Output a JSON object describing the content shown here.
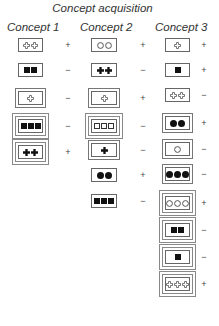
{
  "title": "Concept acquisition",
  "columns": [
    {
      "label": "Concept 1",
      "items": [
        {
          "border": 1,
          "shape": "cross",
          "fill": "outline",
          "count": 2,
          "sign": "+"
        },
        {
          "border": 1,
          "shape": "square",
          "fill": "filled",
          "count": 2,
          "sign": "−"
        },
        {
          "border": 2,
          "shape": "cross",
          "fill": "outline",
          "count": 1,
          "sign": "−"
        },
        {
          "border": 3,
          "shape": "square",
          "fill": "filled",
          "count": 3,
          "sign": "−"
        },
        {
          "border": 3,
          "shape": "cross",
          "fill": "filled",
          "count": 2,
          "sign": "+"
        }
      ]
    },
    {
      "label": "Concept 2",
      "items": [
        {
          "border": 1,
          "shape": "circle",
          "fill": "outline",
          "count": 2,
          "sign": "+"
        },
        {
          "border": 1,
          "shape": "cross",
          "fill": "filled",
          "count": 2,
          "sign": "−"
        },
        {
          "border": 2,
          "shape": "cross",
          "fill": "outline",
          "count": 1,
          "sign": "+"
        },
        {
          "border": 3,
          "shape": "square",
          "fill": "outline",
          "count": 3,
          "sign": "−"
        },
        {
          "border": 2,
          "shape": "cross",
          "fill": "filled",
          "count": 1,
          "sign": "−"
        },
        {
          "border": 1,
          "shape": "circle",
          "fill": "filled",
          "count": 2,
          "sign": "+"
        },
        {
          "border": 1,
          "shape": "square",
          "fill": "filled",
          "count": 3,
          "sign": "−"
        }
      ]
    },
    {
      "label": "Concept 3",
      "items": [
        {
          "border": 1,
          "shape": "cross",
          "fill": "outline",
          "count": 1,
          "sign": "+"
        },
        {
          "border": 1,
          "shape": "square",
          "fill": "filled",
          "count": 1,
          "sign": "+"
        },
        {
          "border": 1,
          "shape": "cross",
          "fill": "outline",
          "count": 2,
          "sign": "−"
        },
        {
          "border": 2,
          "shape": "circle",
          "fill": "filled",
          "count": 2,
          "sign": "+"
        },
        {
          "border": 2,
          "shape": "circle",
          "fill": "outline",
          "count": 1,
          "sign": "−"
        },
        {
          "border": 2,
          "shape": "circle",
          "fill": "filled",
          "count": 3,
          "sign": "−"
        },
        {
          "border": 3,
          "shape": "circle",
          "fill": "outline",
          "count": 3,
          "sign": "+"
        },
        {
          "border": 3,
          "shape": "square",
          "fill": "filled",
          "count": 2,
          "sign": "−"
        },
        {
          "border": 3,
          "shape": "square",
          "fill": "filled",
          "count": 1,
          "sign": "−"
        },
        {
          "border": 3,
          "shape": "cross",
          "fill": "outline",
          "count": 3,
          "sign": "+"
        }
      ]
    }
  ],
  "colors": {
    "ink": "#111111",
    "border": "#666666",
    "background": "#ffffff"
  }
}
